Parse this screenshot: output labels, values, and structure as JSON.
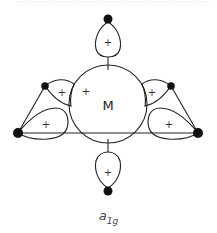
{
  "diagram": {
    "center_atom_label": "M",
    "lobe_sign": "+",
    "caption": {
      "main": "a",
      "subscript": "1g"
    },
    "colors": {
      "line": "#222222",
      "atom": "#111111",
      "background": "#ffffff"
    },
    "atoms": [
      {
        "name": "top",
        "x": 108,
        "y": 19
      },
      {
        "name": "bottom",
        "x": 108,
        "y": 191
      },
      {
        "name": "upper-left",
        "x": 45,
        "y": 86
      },
      {
        "name": "upper-right",
        "x": 171,
        "y": 86
      },
      {
        "name": "lower-left",
        "x": 18,
        "y": 133
      },
      {
        "name": "lower-right",
        "x": 198,
        "y": 133
      }
    ],
    "plus_signs": [
      {
        "x": 108,
        "y": 42
      },
      {
        "x": 108,
        "y": 172
      },
      {
        "x": 63,
        "y": 91
      },
      {
        "x": 86,
        "y": 91
      },
      {
        "x": 152,
        "y": 91
      },
      {
        "x": 46,
        "y": 123
      },
      {
        "x": 169,
        "y": 123
      }
    ]
  }
}
